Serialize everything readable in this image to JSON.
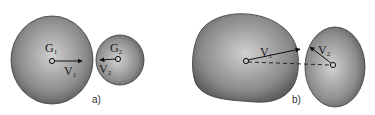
{
  "diagram": {
    "panels": [
      {
        "caption": "a)",
        "bodies": [
          {
            "name": "G",
            "sub": "1",
            "shape": "circle"
          },
          {
            "name": "G",
            "sub": "2",
            "shape": "circle"
          }
        ],
        "vectors": [
          {
            "name": "V",
            "sub": "1"
          },
          {
            "name": "V",
            "sub": "2"
          }
        ]
      },
      {
        "caption": "b)",
        "bodies": [
          {
            "shape": "irregular"
          },
          {
            "shape": "ellipse"
          }
        ],
        "vectors": [
          {
            "name": "V",
            "sub": "1"
          },
          {
            "name": "V",
            "sub": "2"
          }
        ],
        "connector": "dashed"
      }
    ],
    "colors": {
      "body_light": "#c8c8c8",
      "body_dark": "#5a5a5a",
      "outline": "#3a3a3a",
      "arrow": "#111111"
    }
  }
}
